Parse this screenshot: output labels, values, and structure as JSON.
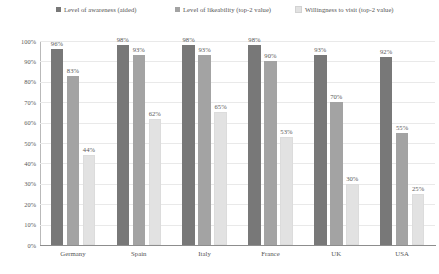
{
  "chart_data": {
    "type": "bar",
    "title": "",
    "subtitle": "",
    "xlabel": "",
    "ylabel": "",
    "ylim": [
      0,
      100
    ],
    "grid": true,
    "legend_position": "top",
    "categories": [
      "Germany",
      "Spain",
      "Italy",
      "France",
      "UK",
      "USA"
    ],
    "ytick_labels": [
      "100%",
      "90%",
      "80%",
      "70%",
      "60%",
      "50%",
      "40%",
      "30%",
      "20%",
      "10%",
      "0%"
    ],
    "ytick_values": [
      100,
      90,
      80,
      70,
      60,
      50,
      40,
      30,
      20,
      10,
      0
    ],
    "series": [
      {
        "name": "Level of awareness (aided)",
        "color": "#787878",
        "values": [
          96,
          98,
          98,
          98,
          93,
          92
        ],
        "labels": [
          "96%",
          "98%",
          "98%",
          "98%",
          "93%",
          "92%"
        ]
      },
      {
        "name": "Level of likeability (top-2 value)",
        "color": "#a3a3a3",
        "values": [
          83,
          93,
          93,
          90,
          70,
          55
        ],
        "labels": [
          "83%",
          "93%",
          "93%",
          "90%",
          "70%",
          "55%"
        ]
      },
      {
        "name": "Willingness to visit (top-2 value)",
        "color": "#e2e2e2",
        "values": [
          44,
          62,
          65,
          53,
          30,
          25
        ],
        "labels": [
          "44%",
          "62%",
          "65%",
          "53%",
          "30%",
          "25%"
        ]
      }
    ]
  }
}
